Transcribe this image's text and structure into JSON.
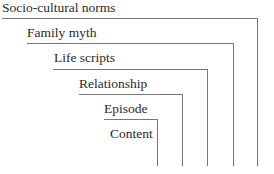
{
  "diagram": {
    "levels": [
      {
        "label": "Socio-cultural norms"
      },
      {
        "label": "Family myth"
      },
      {
        "label": "Life scripts"
      },
      {
        "label": "Relationship"
      },
      {
        "label": "Episode"
      },
      {
        "label": "Content"
      }
    ],
    "line_color": "#777777",
    "text_color": "#2a2a2a"
  }
}
